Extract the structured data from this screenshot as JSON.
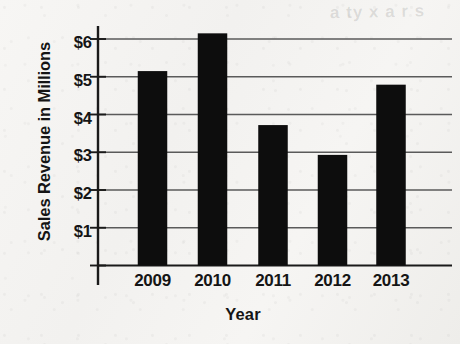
{
  "chart_data": {
    "type": "bar",
    "title": "",
    "xlabel": "Year",
    "ylabel": "Sales Revenue in Millions",
    "categories": [
      "2009",
      "2010",
      "2011",
      "2012",
      "2013"
    ],
    "values": [
      5.15,
      6.15,
      3.72,
      2.93,
      4.79
    ],
    "ylim": [
      0,
      6.6
    ],
    "yticks": [
      1,
      2,
      3,
      4,
      5,
      6
    ],
    "ytick_labels": [
      "$1",
      "$2",
      "$3",
      "$4",
      "$5",
      "$6"
    ],
    "grid": true,
    "grid_axis": "y",
    "legend": false,
    "bar_color": "#0d0d0d",
    "axis_color": "#1a1a1a",
    "grid_color": "#5a5a5a",
    "background_color": "#f4f3f1"
  },
  "artifacts": {
    "bleed_through_text": "a ty x a r s"
  }
}
